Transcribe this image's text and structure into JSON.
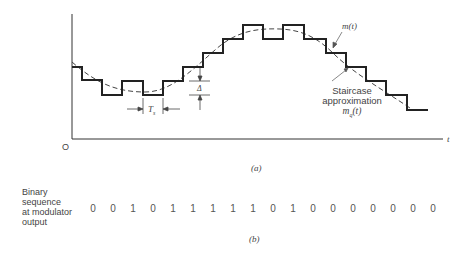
{
  "figure_a": {
    "caption": "(a)",
    "origin_label": "O",
    "x_axis_label": "t",
    "signal_label": "m(t)",
    "staircase_label_lines": [
      "Staircase",
      "approximation"
    ],
    "staircase_symbol": "m_q(t)",
    "step_width_label": "T_s",
    "step_height_label": "Δ"
  },
  "figure_b": {
    "caption": "(b)",
    "row_label_lines": [
      "Binary",
      "sequence",
      "at modulator",
      "output"
    ],
    "bits": [
      "0",
      "0",
      "1",
      "0",
      "1",
      "1",
      "1",
      "1",
      "1",
      "0",
      "1",
      "0",
      "0",
      "0",
      "0",
      "0",
      "0",
      "0"
    ]
  }
}
